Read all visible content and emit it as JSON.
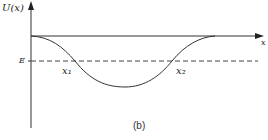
{
  "diagram": {
    "y_axis_label": "U(x)",
    "x_axis_label": "x",
    "energy_label": "E",
    "turning_point_1": "x₁",
    "turning_point_2": "x₂",
    "caption": "(b)",
    "colors": {
      "line": "#333333",
      "background": "#ffffff"
    }
  }
}
